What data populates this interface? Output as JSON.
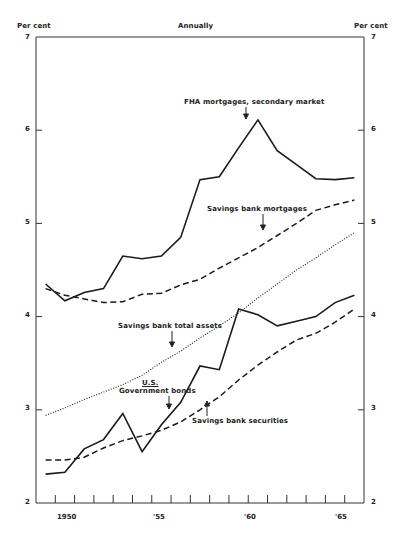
{
  "header": {
    "left_unit": "Per cent",
    "center_title": "Annually",
    "right_unit": "Per cent"
  },
  "axes": {
    "y_ticks": [
      "7",
      "6",
      "5",
      "4",
      "3",
      "2"
    ],
    "x_labels": [
      "1950",
      "'55",
      "'60",
      "'65"
    ]
  },
  "annotations": {
    "fha": "FHA mortgages, secondary market",
    "sb_mortgages": "Savings bank mortgages",
    "sb_total_assets": "Savings bank total assets",
    "gov_bonds_line1": "U.S.",
    "gov_bonds_line2": "Government bonds",
    "sb_securities": "Savings bank securities"
  },
  "chart_data": {
    "type": "line",
    "title": "Annually",
    "xlabel": "",
    "ylabel": "Per cent",
    "ylim": [
      2,
      7
    ],
    "xlim": [
      1948.5,
      1965.5
    ],
    "grid": false,
    "x_tick_labels": [
      "1950",
      "'55",
      "'60",
      "'65"
    ],
    "y_tick_labels": [
      "2",
      "3",
      "4",
      "5",
      "6",
      "7"
    ],
    "x": [
      1949,
      1950,
      1951,
      1952,
      1953,
      1954,
      1955,
      1956,
      1957,
      1958,
      1959,
      1960,
      1961,
      1962,
      1963,
      1964,
      1965
    ],
    "series": [
      {
        "name": "FHA mortgages, secondary market",
        "style": "solid",
        "values": [
          4.35,
          4.17,
          4.26,
          4.3,
          4.65,
          4.62,
          4.65,
          4.85,
          5.47,
          5.5,
          5.81,
          6.11,
          5.78,
          5.63,
          5.48,
          5.47,
          5.49
        ]
      },
      {
        "name": "Savings bank mortgages",
        "style": "dashed",
        "values": [
          4.3,
          4.23,
          4.19,
          4.15,
          4.16,
          4.24,
          4.25,
          4.34,
          4.4,
          4.52,
          4.63,
          4.74,
          4.87,
          5.0,
          5.14,
          5.2,
          5.25
        ]
      },
      {
        "name": "Savings bank total assets",
        "style": "dotted",
        "values": [
          2.94,
          3.02,
          3.11,
          3.19,
          3.27,
          3.37,
          3.51,
          3.63,
          3.77,
          3.9,
          4.04,
          4.2,
          4.35,
          4.5,
          4.63,
          4.77,
          4.9
        ]
      },
      {
        "name": "U.S. Government bonds",
        "style": "solid",
        "values": [
          2.31,
          2.33,
          2.58,
          2.68,
          2.96,
          2.55,
          2.84,
          3.08,
          3.47,
          3.43,
          4.08,
          4.02,
          3.9,
          3.95,
          4.0,
          4.15,
          4.23
        ]
      },
      {
        "name": "Savings bank securities",
        "style": "dashed",
        "values": [
          2.46,
          2.46,
          2.49,
          2.59,
          2.67,
          2.72,
          2.78,
          2.87,
          3.0,
          3.14,
          3.32,
          3.48,
          3.62,
          3.75,
          3.82,
          3.94,
          4.08
        ]
      }
    ]
  }
}
